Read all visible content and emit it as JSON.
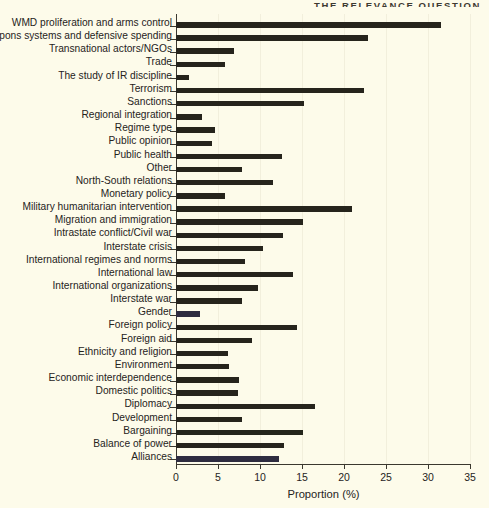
{
  "running_head": {
    "text": "THE RELEVANCE QUESTION"
  },
  "chart_data": {
    "type": "bar",
    "orientation": "horizontal",
    "title": "",
    "xlabel": "Proportion (%)",
    "ylabel": "",
    "xlim": [
      0,
      35
    ],
    "xticks": [
      0,
      5,
      10,
      15,
      20,
      25,
      30,
      35
    ],
    "xtick_labels": [
      "0",
      "5",
      "10",
      "15",
      "20",
      "25",
      "30",
      "35"
    ],
    "grid": "vertical-faint",
    "legend": "none",
    "bar_color": "#26241c",
    "background_color": "#fdfbea",
    "categories": [
      "WMD proliferation and arms control",
      "Weapons systems and defensive spending",
      "Transnational actors/NGOs",
      "Trade",
      "The study of IR discipline",
      "Terrorism",
      "Sanctions",
      "Regional integration",
      "Regime type",
      "Public opinion",
      "Public health",
      "Other",
      "North-South relations",
      "Monetary policy",
      "Military humanitarian intervention",
      "Migration and immigration",
      "Intrastate conflict/Civil war",
      "Interstate crisis",
      "International regimes and norms",
      "International law",
      "International organizations",
      "Interstate war",
      "Gender",
      "Foreign policy",
      "Foreign aid",
      "Ethnicity and religion",
      "Environment",
      "Economic interdependence",
      "Domestic politics",
      "Diplomacy",
      "Development",
      "Bargaining",
      "Balance of power",
      "Alliances"
    ],
    "values": [
      31.6,
      22.9,
      6.9,
      5.8,
      1.6,
      22.4,
      15.2,
      3.1,
      4.6,
      4.3,
      12.6,
      7.8,
      11.6,
      5.8,
      21.0,
      15.1,
      12.7,
      10.4,
      8.2,
      13.9,
      9.8,
      7.9,
      2.9,
      14.4,
      9.0,
      6.2,
      6.3,
      7.5,
      7.4,
      16.5,
      7.8,
      15.1,
      12.9,
      12.3
    ]
  }
}
